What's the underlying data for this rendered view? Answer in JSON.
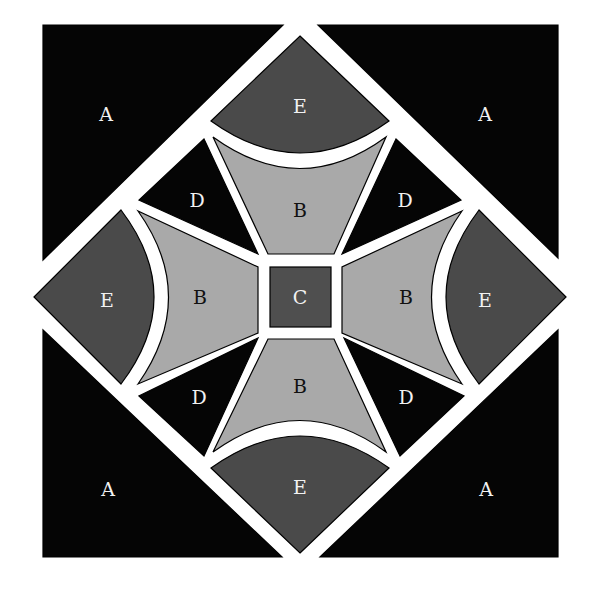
{
  "diagram": {
    "colors": {
      "background": "#ffffff",
      "A": "#050505",
      "B": "#a9a9a9",
      "C": "#4f4f4f",
      "D": "#050505",
      "E": "#4a4a4a",
      "light_text": "#f2f2f2",
      "dark_text": "#111111"
    },
    "labels": {
      "a_tl": "A",
      "a_tr": "A",
      "a_bl": "A",
      "a_br": "A",
      "e_top": "E",
      "e_left": "E",
      "e_right": "E",
      "e_bottom": "E",
      "b_top": "B",
      "b_left": "B",
      "b_right": "B",
      "b_bottom": "B",
      "d_tl": "D",
      "d_tr": "D",
      "d_bl": "D",
      "d_br": "D",
      "c_center": "C"
    },
    "pieces": [
      {
        "id": "A",
        "count": 4,
        "shape": "corner triangle"
      },
      {
        "id": "B",
        "count": 4,
        "shape": "curved trapezoid"
      },
      {
        "id": "C",
        "count": 1,
        "shape": "center square"
      },
      {
        "id": "D",
        "count": 4,
        "shape": "triangle"
      },
      {
        "id": "E",
        "count": 4,
        "shape": "curved wedge"
      }
    ]
  }
}
